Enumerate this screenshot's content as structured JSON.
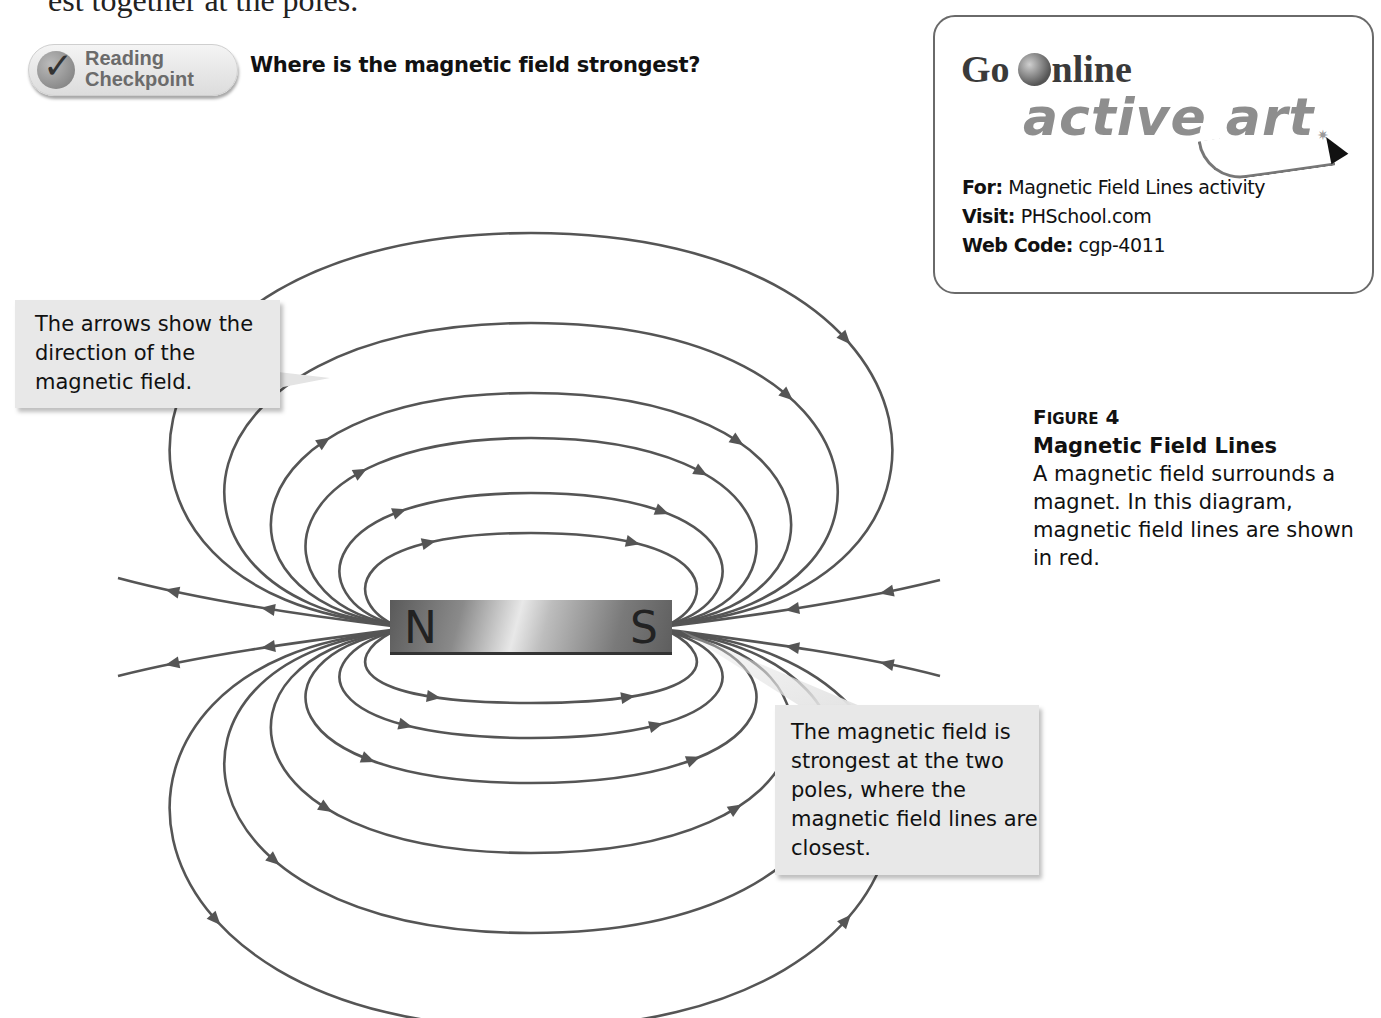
{
  "page": {
    "top_text": "est together at the poles."
  },
  "reading_checkpoint": {
    "label_line1": "Reading",
    "label_line2": "Checkpoint",
    "icon": "checkmark-icon",
    "question": "Where is the magnetic field strongest?"
  },
  "go_online": {
    "title_go": "Go",
    "title_online": "nline",
    "subtitle": "active art",
    "for_label": "For:",
    "for_value": "Magnetic Field Lines activity",
    "visit_label": "Visit:",
    "visit_value": "PHSchool.com",
    "webcode_label": "Web Code:",
    "webcode_value": "cgp-4011"
  },
  "callouts": {
    "arrows": "The arrows show the direction of the magnetic field.",
    "strongest": "The magnetic field is strongest at the two poles, where the magnetic field lines are closest."
  },
  "figure": {
    "number_prefix": "F",
    "number_rest": "IGURE",
    "number": "4",
    "title": "Magnetic Field Lines",
    "body": "A magnetic field surrounds a magnet. In this diagram, magnetic field lines are shown in red."
  },
  "magnet": {
    "north_label": "N",
    "south_label": "S"
  },
  "diagram": {
    "line_color": "#555555",
    "loops": [
      {
        "rx": 45,
        "top": 60,
        "bottom": 45
      },
      {
        "rx": 80,
        "top": 100,
        "bottom": 80
      },
      {
        "rx": 125,
        "top": 155,
        "bottom": 125
      },
      {
        "rx": 170,
        "top": 200,
        "bottom": 195
      },
      {
        "rx": 230,
        "top": 270,
        "bottom": 275
      },
      {
        "rx": 300,
        "top": 360,
        "bottom": 370
      }
    ]
  }
}
